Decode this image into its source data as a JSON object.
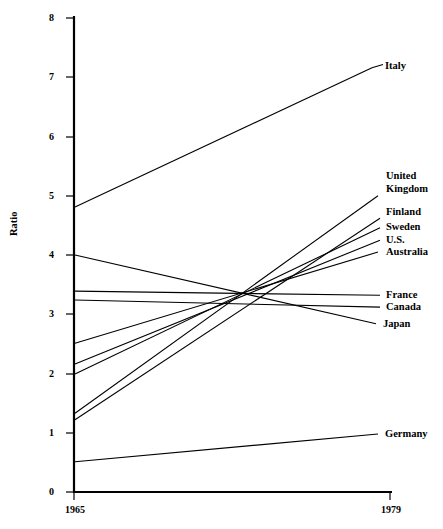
{
  "chart_data": {
    "type": "line",
    "title": "",
    "xlabel": "",
    "ylabel": "Ratio",
    "x": [
      1965,
      1979
    ],
    "xtick_labels": [
      "1965",
      "1979"
    ],
    "ytick_labels": [
      "0",
      "1",
      "2",
      "3",
      "4",
      "5",
      "6",
      "7",
      "8"
    ],
    "ytick_values": [
      0,
      1,
      2,
      3,
      4,
      5,
      6,
      7,
      8
    ],
    "ylim": [
      0,
      8
    ],
    "xlim": [
      1965,
      1979
    ],
    "grid": false,
    "legend": "right-inline-labels",
    "series": [
      {
        "name": "Italy",
        "values": [
          4.81,
          7.16
        ]
      },
      {
        "name": "United Kingdom",
        "values": [
          1.33,
          5.0
        ]
      },
      {
        "name": "Finland",
        "values": [
          1.22,
          4.62
        ]
      },
      {
        "name": "Sweden",
        "values": [
          1.99,
          4.46
        ]
      },
      {
        "name": "U.S.",
        "values": [
          2.16,
          4.25
        ]
      },
      {
        "name": "Australia",
        "values": [
          2.51,
          4.05
        ]
      },
      {
        "name": "France",
        "values": [
          3.39,
          3.32
        ]
      },
      {
        "name": "Canada",
        "values": [
          3.24,
          3.12
        ]
      },
      {
        "name": "Japan",
        "values": [
          4.0,
          2.84
        ]
      },
      {
        "name": "Germany",
        "values": [
          0.51,
          0.98
        ]
      }
    ]
  },
  "labels": {
    "italy": "Italy",
    "united_kingdom_line1": "United",
    "united_kingdom_line2": "Kingdom",
    "finland": "Finland",
    "sweden": "Sweden",
    "us": "U.S.",
    "australia": "Australia",
    "france": "France",
    "canada": "Canada",
    "japan": "Japan",
    "germany": "Germany"
  },
  "axis": {
    "y_title": "Ratio",
    "y0": "0",
    "y1": "1",
    "y2": "2",
    "y3": "3",
    "y4": "4",
    "y5": "5",
    "y6": "6",
    "y7": "7",
    "y8": "8",
    "x_start": "1965",
    "x_end": "1979"
  },
  "colors": {
    "line": "#000000",
    "background": "#ffffff",
    "text": "#000000"
  }
}
